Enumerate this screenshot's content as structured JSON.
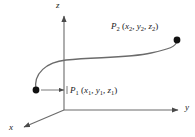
{
  "figure": {
    "background_color": "#ffffff",
    "line_color": "#5a5a5a",
    "text_color": "#1a1a1a",
    "dot_color": "#000000"
  },
  "axes": [
    {
      "id": "z",
      "label": "z",
      "direction": "up",
      "origin": [
        64,
        110
      ],
      "tip": [
        64,
        14
      ]
    },
    {
      "id": "y",
      "label": "y",
      "direction": "right",
      "origin": [
        64,
        110
      ],
      "tip": [
        181,
        110
      ]
    },
    {
      "id": "x",
      "label": "x",
      "direction": "down-left",
      "origin": [
        64,
        110
      ],
      "tip": [
        22,
        128
      ]
    }
  ],
  "points": [
    {
      "id": "P1",
      "symbol": "P",
      "subscript": "1",
      "coordinates": [
        "x",
        "y",
        "z"
      ],
      "coordinate_subscripts": [
        "1",
        "1",
        "1"
      ],
      "label_text": "P1 (x1, y1, z1)",
      "dot_position": [
        36,
        90
      ],
      "leader_from": [
        43,
        90
      ],
      "leader_to": [
        67,
        90
      ]
    },
    {
      "id": "P2",
      "symbol": "P",
      "subscript": "2",
      "coordinates": [
        "x",
        "y",
        "z"
      ],
      "coordinate_subscripts": [
        "2",
        "2",
        "2"
      ],
      "label_text": "P2 (x2, y2, z2)",
      "dot_position": [
        177,
        40
      ],
      "leader_from": null,
      "leader_to": null
    }
  ],
  "curve": {
    "description": "S-shaped curve from P1 rising and bending right, then sweeping up to P2",
    "path": "M 36 90 C 34 74, 46 63, 64 61 C 96 58, 128 58, 150 54 C 168 51, 176 48, 177 40"
  }
}
